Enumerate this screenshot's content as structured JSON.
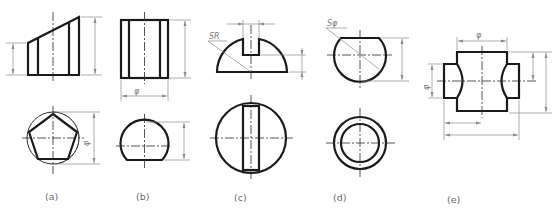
{
  "figure": {
    "stroke_color": "#1a1a1a",
    "dimension_color": "#8a8a8a",
    "caption_color": "#6a6a6a"
  },
  "panels": [
    {
      "id": "a",
      "caption": "(a)",
      "shape": "truncated pentagonal prism",
      "dimension_labels": [
        "φ"
      ]
    },
    {
      "id": "b",
      "caption": "(b)",
      "shape": "cylinder with flattened sides",
      "dimension_labels": [
        "φ"
      ]
    },
    {
      "id": "c",
      "caption": "(c)",
      "shape": "hemisphere with slot",
      "dimension_labels": [
        "SR"
      ]
    },
    {
      "id": "d",
      "caption": "(d)",
      "shape": "truncated sphere with bore",
      "dimension_labels": [
        "Sφ"
      ]
    },
    {
      "id": "e",
      "caption": "(e)",
      "shape": "cylinder with intersecting cross bore",
      "dimension_labels": [
        "φ",
        "φ"
      ]
    }
  ]
}
